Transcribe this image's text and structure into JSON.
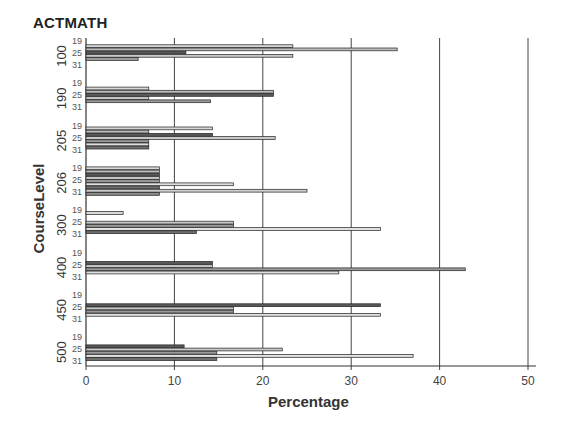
{
  "chart_data": {
    "type": "bar",
    "orientation": "horizontal",
    "title": "ACTMATH",
    "xlabel": "Percentage",
    "ylabel": "CourseLevel",
    "xlim": [
      0,
      50
    ],
    "xticks": [
      0,
      10,
      20,
      30,
      40,
      50
    ],
    "grid": "vertical",
    "inner_tick_labels": [
      "19",
      "25",
      "31"
    ],
    "groups": [
      {
        "label": "100",
        "values": [
          23.4,
          35.2,
          11.3,
          23.4,
          5.9
        ]
      },
      {
        "label": "190",
        "values": [
          7.1,
          21.2,
          21.2,
          7.1,
          14.1
        ]
      },
      {
        "label": "205",
        "values": [
          14.3,
          7.1,
          14.3,
          21.4,
          7.1,
          7.1,
          7.1
        ]
      },
      {
        "label": "206",
        "values": [
          8.3,
          8.3,
          8.3,
          8.3,
          8.3,
          16.7,
          8.3,
          25.0,
          8.3
        ]
      },
      {
        "label": "300",
        "values": [
          4.2,
          0,
          0,
          16.7,
          16.7,
          33.3,
          12.5
        ]
      },
      {
        "label": "400",
        "values": [
          0,
          0,
          14.3,
          14.3,
          42.9,
          28.6
        ]
      },
      {
        "label": "450",
        "values": [
          0,
          0,
          33.3,
          16.7,
          16.7,
          33.3
        ]
      },
      {
        "label": "500",
        "values": [
          0,
          0,
          11.1,
          22.2,
          14.8,
          37.0,
          14.8
        ]
      }
    ]
  }
}
